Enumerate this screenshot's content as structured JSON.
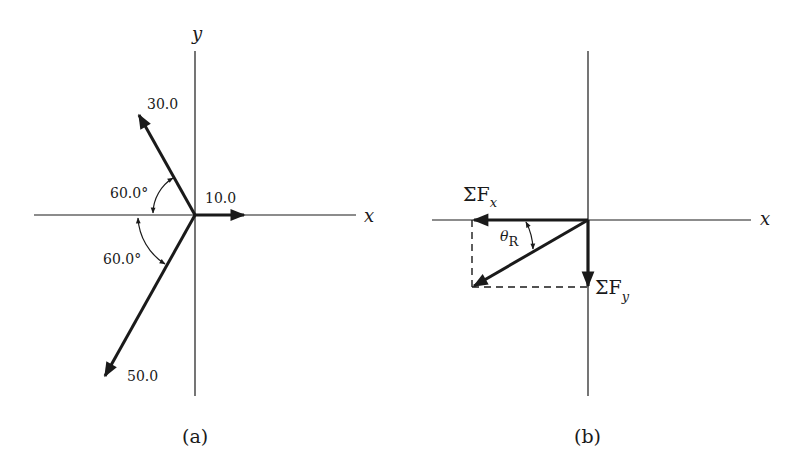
{
  "panel_a": {
    "caption": "(a)",
    "axis_x_label": "x",
    "axis_y_label": "y",
    "vectors": [
      {
        "name": "force-30",
        "magnitude_label": "30.0",
        "angle_from_neg_x_deg": 60.0,
        "direction": "up-left"
      },
      {
        "name": "force-10",
        "magnitude_label": "10.0",
        "direction": "+x"
      },
      {
        "name": "force-50",
        "magnitude_label": "50.0",
        "angle_from_neg_x_deg": 60.0,
        "direction": "down-left"
      }
    ],
    "angle_upper_label": "60.0°",
    "angle_lower_label": "60.0°"
  },
  "panel_b": {
    "caption": "(b)",
    "axis_x_label": "x",
    "sum_fx_label": "ΣF",
    "sum_fx_sub": "x",
    "sum_fy_label": "ΣF",
    "sum_fy_sub": "y",
    "theta_label": "θ",
    "theta_sub": "R"
  },
  "colors": {
    "ink": "#1a1a1a",
    "background": "#ffffff"
  }
}
